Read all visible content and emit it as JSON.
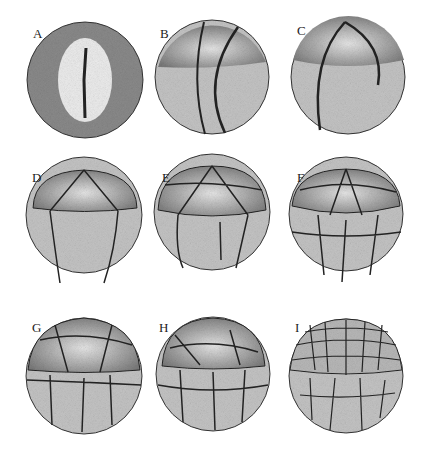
{
  "figure": {
    "panels": [
      {
        "id": "A",
        "label": "A",
        "x": 25,
        "y": 20,
        "cx": 85,
        "cy": 80,
        "r": 58
      },
      {
        "id": "B",
        "label": "B",
        "x": 155,
        "y": 20,
        "cx": 212,
        "cy": 77,
        "r": 57
      },
      {
        "id": "C",
        "label": "C",
        "x": 295,
        "y": 20,
        "cx": 348,
        "cy": 77,
        "r": 57
      },
      {
        "id": "D",
        "label": "D",
        "x": 30,
        "y": 165,
        "cx": 84,
        "cy": 215,
        "r": 58
      },
      {
        "id": "E",
        "label": "E",
        "x": 160,
        "y": 165,
        "cx": 212,
        "cy": 212,
        "r": 58
      },
      {
        "id": "F",
        "label": "F",
        "x": 295,
        "y": 165,
        "cx": 346,
        "cy": 214,
        "r": 57
      },
      {
        "id": "G",
        "label": "G",
        "x": 30,
        "y": 320,
        "cx": 84,
        "cy": 376,
        "r": 58
      },
      {
        "id": "H",
        "label": "H",
        "x": 157,
        "y": 320,
        "cx": 213,
        "cy": 374,
        "r": 57
      },
      {
        "id": "I",
        "label": "I",
        "x": 295,
        "y": 320,
        "cx": 346,
        "cy": 376,
        "r": 57
      }
    ]
  }
}
